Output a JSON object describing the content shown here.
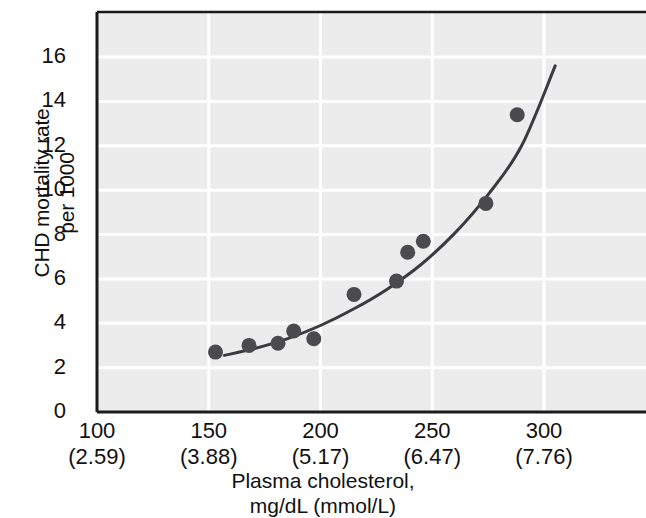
{
  "chart_data": {
    "type": "scatter",
    "title": "",
    "xlabel": "Plasma cholesterol,\nmg/dL (mmol/L)",
    "xlabel_line1": "Plasma cholesterol,",
    "xlabel_line2": "mg/dL (mmol/L)",
    "ylabel": "CHD mortality rate\nper 1000",
    "ylabel_line1": "CHD mortality rate",
    "ylabel_line2": "per 1000",
    "xlim": [
      100,
      300
    ],
    "ylim": [
      0,
      17
    ],
    "grid": true,
    "legend": "none",
    "plot_bgcolor": "#ececed",
    "gridline_color": "#ffffff",
    "axis_color": "#1a1a1a",
    "marker_color": "#4a4a4f",
    "curve_color": "#3a3a3f",
    "yticks": [
      0,
      2,
      4,
      6,
      8,
      10,
      12,
      14,
      16
    ],
    "ytick_labels": [
      "0",
      "2",
      "4",
      "6",
      "8",
      "10",
      "12",
      "14",
      "16"
    ],
    "xticks": [
      100,
      150,
      200,
      250,
      300
    ],
    "xtick_labels_mg": [
      "100",
      "150",
      "200",
      "250",
      "300"
    ],
    "xtick_labels_mmol": [
      "(2.59)",
      "(3.88)",
      "(5.17)",
      "(6.47)",
      "(7.76)"
    ],
    "points": [
      {
        "x": 153,
        "y": 2.7
      },
      {
        "x": 168,
        "y": 3.0
      },
      {
        "x": 181,
        "y": 3.1
      },
      {
        "x": 188,
        "y": 3.65
      },
      {
        "x": 197,
        "y": 3.3
      },
      {
        "x": 215,
        "y": 5.3
      },
      {
        "x": 234,
        "y": 5.9
      },
      {
        "x": 239,
        "y": 7.2
      },
      {
        "x": 246,
        "y": 7.7
      },
      {
        "x": 274,
        "y": 9.4
      },
      {
        "x": 288,
        "y": 13.4
      }
    ],
    "fit_curve": {
      "label": "exponential fit",
      "x_start": 157,
      "x_end": 305,
      "points": [
        {
          "x": 157,
          "y": 2.55
        },
        {
          "x": 170,
          "y": 2.85
        },
        {
          "x": 185,
          "y": 3.3
        },
        {
          "x": 200,
          "y": 3.9
        },
        {
          "x": 215,
          "y": 4.65
        },
        {
          "x": 230,
          "y": 5.55
        },
        {
          "x": 245,
          "y": 6.65
        },
        {
          "x": 260,
          "y": 8.05
        },
        {
          "x": 275,
          "y": 9.8
        },
        {
          "x": 290,
          "y": 12.0
        },
        {
          "x": 305,
          "y": 15.6
        }
      ]
    }
  }
}
